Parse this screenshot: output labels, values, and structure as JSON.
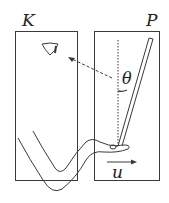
{
  "diagram": {
    "frames": [
      {
        "id": "K",
        "label": "K"
      },
      {
        "id": "P",
        "label": "P"
      }
    ],
    "angle_label": "θ",
    "velocity_label": "u",
    "colors": {
      "stroke": "#3a3a3a",
      "background": "#ffffff"
    }
  }
}
